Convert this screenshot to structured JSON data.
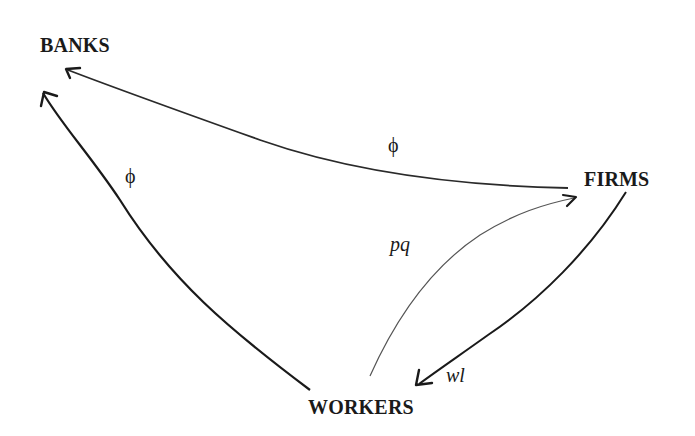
{
  "diagram": {
    "nodes": {
      "banks": "BANKS",
      "firms": "FIRMS",
      "workers": "WORKERS"
    },
    "edges": [
      {
        "from": "FIRMS",
        "to": "BANKS",
        "label": "ϕ"
      },
      {
        "from": "WORKERS",
        "to": "BANKS",
        "label": "ϕ"
      },
      {
        "from": "WORKERS",
        "to": "FIRMS",
        "label": "pq"
      },
      {
        "from": "FIRMS",
        "to": "WORKERS",
        "label": "wl"
      }
    ]
  },
  "colors": {
    "stroke": "#1a1a1a",
    "faint_stroke": "#555555",
    "background": "#ffffff"
  }
}
